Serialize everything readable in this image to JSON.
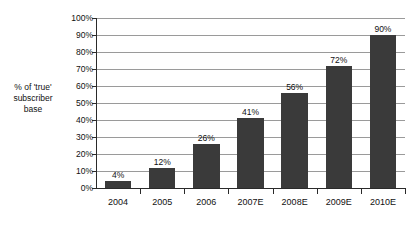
{
  "chart_data": {
    "type": "bar",
    "title": "",
    "subtitle": "",
    "xlabel": "",
    "ylabel": "% of 'true'\nsubscriber\nbase",
    "categories": [
      "2004",
      "2005",
      "2006",
      "2007E",
      "2008E",
      "2009E",
      "2010E"
    ],
    "values": [
      4,
      12,
      26,
      41,
      56,
      72,
      90
    ],
    "data_labels": [
      "4%",
      "12%",
      "26%",
      "41%",
      "56%",
      "72%",
      "90%"
    ],
    "ylim": [
      0,
      100
    ],
    "y_ticks": [
      0,
      10,
      20,
      30,
      40,
      50,
      60,
      70,
      80,
      90,
      100
    ],
    "y_tick_labels": [
      "0%",
      "10%",
      "20%",
      "30%",
      "40%",
      "50%",
      "60%",
      "70%",
      "80%",
      "90%",
      "100%"
    ],
    "grid": true,
    "grid_axis": "y",
    "legend": false,
    "legend_position": "none",
    "series": [
      {
        "name": "% of 'true' subscriber base",
        "values": [
          4,
          12,
          26,
          41,
          56,
          72,
          90
        ],
        "color": "#3a3a3a"
      }
    ],
    "colors": {
      "bar": "#3a3a3a",
      "gridline": "#9a9a9a",
      "axis": "#2a2a2a",
      "background": "#ffffff",
      "text": "#111111"
    }
  }
}
